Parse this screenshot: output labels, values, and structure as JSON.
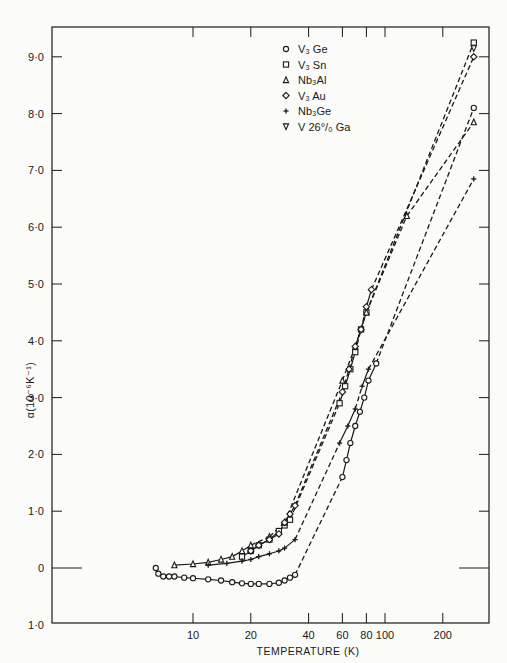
{
  "chart_data": {
    "type": "line",
    "title": "",
    "xlabel": "TEMPERATURE  (K)",
    "ylabel": "α(10⁻⁶K⁻¹)",
    "xscale": "log",
    "xlim": [
      1.84,
      348
    ],
    "ylim": [
      -1.0,
      9.5
    ],
    "grid": false,
    "legend_position": "upper-center",
    "x_ticks": [
      10,
      20,
      40,
      60,
      80,
      100,
      200
    ],
    "x_tick_labels": [
      "10",
      "20",
      "40",
      "60",
      "80",
      "100",
      "200"
    ],
    "y_ticks": [
      9.0,
      8.0,
      7.0,
      6.0,
      5.0,
      4.0,
      3.0,
      2.0,
      1.0,
      0,
      -1.0
    ],
    "y_tick_labels": [
      "9·0",
      "8·0",
      "7·0",
      "6·0",
      "5·0",
      "4·0",
      "3·0",
      "2·0",
      "1·0",
      "0",
      "1·0"
    ],
    "series": [
      {
        "name": "V₃Ge",
        "marker": "circle",
        "x": [
          6.4,
          6.6,
          7,
          7.5,
          8,
          9,
          10,
          12,
          14,
          16,
          18,
          20,
          22,
          25,
          28,
          30,
          32,
          34,
          60,
          63,
          66,
          70,
          74,
          78,
          82,
          90,
          290
        ],
        "y": [
          0.0,
          -0.1,
          -0.15,
          -0.15,
          -0.15,
          -0.17,
          -0.18,
          -0.2,
          -0.22,
          -0.25,
          -0.27,
          -0.28,
          -0.28,
          -0.28,
          -0.26,
          -0.22,
          -0.17,
          -0.12,
          1.6,
          1.9,
          2.2,
          2.5,
          2.75,
          3.0,
          3.3,
          3.6,
          8.1
        ]
      },
      {
        "name": "V₃Sn",
        "marker": "square",
        "x": [
          18,
          20,
          22,
          25,
          28,
          30,
          32,
          58,
          62,
          66,
          70,
          75,
          80,
          290
        ],
        "y": [
          0.2,
          0.3,
          0.4,
          0.5,
          0.65,
          0.75,
          0.85,
          2.9,
          3.2,
          3.5,
          3.8,
          4.2,
          4.5,
          9.25
        ]
      },
      {
        "name": "Nb₃Al",
        "marker": "triangle-up",
        "x": [
          8,
          10,
          12,
          14,
          16,
          18,
          20,
          25,
          30,
          60,
          70,
          80,
          130,
          290
        ],
        "y": [
          0.05,
          0.07,
          0.1,
          0.15,
          0.2,
          0.3,
          0.4,
          0.55,
          0.8,
          3.3,
          3.9,
          4.5,
          6.2,
          7.85
        ]
      },
      {
        "name": "V₃Au",
        "marker": "diamond",
        "x": [
          20,
          22,
          25,
          28,
          30,
          32,
          34,
          60,
          65,
          70,
          75,
          80,
          85,
          290
        ],
        "y": [
          0.3,
          0.4,
          0.5,
          0.6,
          0.8,
          0.95,
          1.1,
          3.1,
          3.5,
          3.9,
          4.2,
          4.6,
          4.9,
          9.0
        ]
      },
      {
        "name": "Nb₃Ge",
        "marker": "plus",
        "x": [
          12,
          15,
          18,
          20,
          22,
          25,
          28,
          30,
          34,
          58,
          64,
          70,
          76,
          82,
          290
        ],
        "y": [
          0.05,
          0.08,
          0.12,
          0.15,
          0.2,
          0.25,
          0.3,
          0.35,
          0.5,
          2.2,
          2.5,
          2.8,
          3.2,
          3.5,
          6.85
        ]
      },
      {
        "name": "V 26°/₀ Ga",
        "marker": "triangle-down",
        "x": [
          290
        ],
        "y": [
          9.15
        ]
      }
    ],
    "annotations": []
  },
  "legend": {
    "entries": [
      {
        "symbol": "circle",
        "label": "V₃ Ge"
      },
      {
        "symbol": "square",
        "label": "V₃ Sn"
      },
      {
        "symbol": "triangle-up",
        "label": "Nb₃Al"
      },
      {
        "symbol": "diamond",
        "label": "V₃ Au"
      },
      {
        "symbol": "plus",
        "label": "Nb₃Ge"
      },
      {
        "symbol": "triangle-down",
        "label": "V 26°/₀ Ga"
      }
    ]
  },
  "colors": {
    "ink": "#1a1a1a",
    "paper": "#fbfbf9"
  }
}
